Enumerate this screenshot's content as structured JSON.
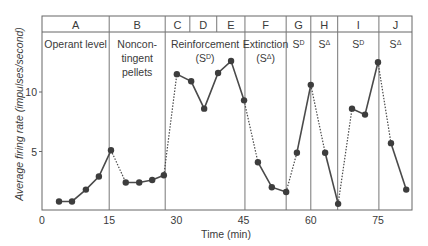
{
  "chart_data": {
    "type": "line",
    "title": "",
    "xlabel": "Time (min)",
    "ylabel": "Average firing rate (impulses/second)",
    "xlim": [
      0,
      82.5
    ],
    "ylim": [
      0,
      14.5
    ],
    "x_ticks": [
      "0",
      "15",
      "30",
      "45",
      "60",
      "75"
    ],
    "y_ticks": [
      "5",
      "10"
    ],
    "grid": false,
    "legend": null,
    "phases": [
      {
        "id": "A",
        "label": "Operant level",
        "start": 0,
        "end": 15
      },
      {
        "id": "B",
        "label": "Noncon-\ntingent\npellets",
        "start": 15,
        "end": 27.5
      },
      {
        "id": "C",
        "label": "",
        "start": 27.5,
        "end": 33
      },
      {
        "id": "D",
        "label": "",
        "start": 33,
        "end": 39
      },
      {
        "id": "E",
        "label": "",
        "start": 39,
        "end": 45.3
      },
      {
        "id": "C-E",
        "label": "Reinforcement\n(SD)",
        "start": 27.5,
        "end": 45.3
      },
      {
        "id": "F",
        "label": "Extinction\n(SΔ)",
        "start": 45.3,
        "end": 54.5
      },
      {
        "id": "G",
        "label": "SD",
        "start": 54.5,
        "end": 60
      },
      {
        "id": "H",
        "label": "SΔ",
        "start": 60,
        "end": 66
      },
      {
        "id": "I",
        "label": "SD",
        "start": 66,
        "end": 75.2
      },
      {
        "id": "J",
        "label": "SΔ",
        "start": 75.2,
        "end": 82.6
      }
    ],
    "series": [
      {
        "name": "A",
        "points": [
          [
            3.8,
            0.8
          ],
          [
            6.7,
            0.8
          ],
          [
            9.8,
            1.8
          ],
          [
            12.7,
            2.9
          ],
          [
            15.4,
            5.1
          ]
        ]
      },
      {
        "name": "B",
        "points": [
          [
            18.7,
            2.4
          ],
          [
            21.7,
            2.4
          ],
          [
            24.6,
            2.6
          ],
          [
            27.2,
            3.0
          ]
        ]
      },
      {
        "name": "C-E",
        "points": [
          [
            30.1,
            11.5
          ],
          [
            33.3,
            10.9
          ],
          [
            36.2,
            8.6
          ],
          [
            39.3,
            11.6
          ],
          [
            42.2,
            12.6
          ],
          [
            45.1,
            9.3
          ]
        ]
      },
      {
        "name": "F",
        "points": [
          [
            48.2,
            4.1
          ],
          [
            51.3,
            2.0
          ],
          [
            54.5,
            1.6
          ]
        ]
      },
      {
        "name": "G",
        "points": [
          [
            56.9,
            4.9
          ],
          [
            60.0,
            10.6
          ]
        ]
      },
      {
        "name": "H",
        "points": [
          [
            63.2,
            4.9
          ],
          [
            66.1,
            0.6
          ]
        ]
      },
      {
        "name": "I",
        "points": [
          [
            69.2,
            8.6
          ],
          [
            72.1,
            8.1
          ],
          [
            75.0,
            12.5
          ]
        ]
      },
      {
        "name": "J",
        "points": [
          [
            77.9,
            5.7
          ],
          [
            81.3,
            1.8
          ]
        ]
      }
    ],
    "dotted_connectors": [
      [
        "A",
        "B"
      ],
      [
        "B",
        "C-E"
      ],
      [
        "C-E",
        "F"
      ],
      [
        "F",
        "G"
      ],
      [
        "G",
        "H"
      ],
      [
        "H",
        "I"
      ],
      [
        "I",
        "J"
      ]
    ]
  }
}
